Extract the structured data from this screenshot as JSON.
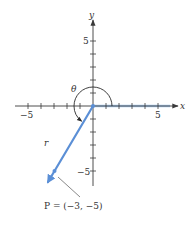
{
  "figure": {
    "axes": {
      "x_label": "x",
      "y_label": "y",
      "x_tick_labels": {
        "neg": "−5",
        "pos": "5"
      },
      "y_tick_labels": {
        "pos": "5",
        "neg": "−5"
      },
      "x_range": [
        -5,
        5
      ],
      "y_range": [
        -5,
        5
      ]
    },
    "ray_label": "r",
    "angle_label": "θ",
    "point_label": "P = (−3, −5)",
    "point": {
      "x": -3,
      "y": -5
    },
    "colors": {
      "ray": "#5b8fd6",
      "positive_x_axis_highlight": "#a9cbee",
      "axes": "#3a3a3a"
    }
  }
}
